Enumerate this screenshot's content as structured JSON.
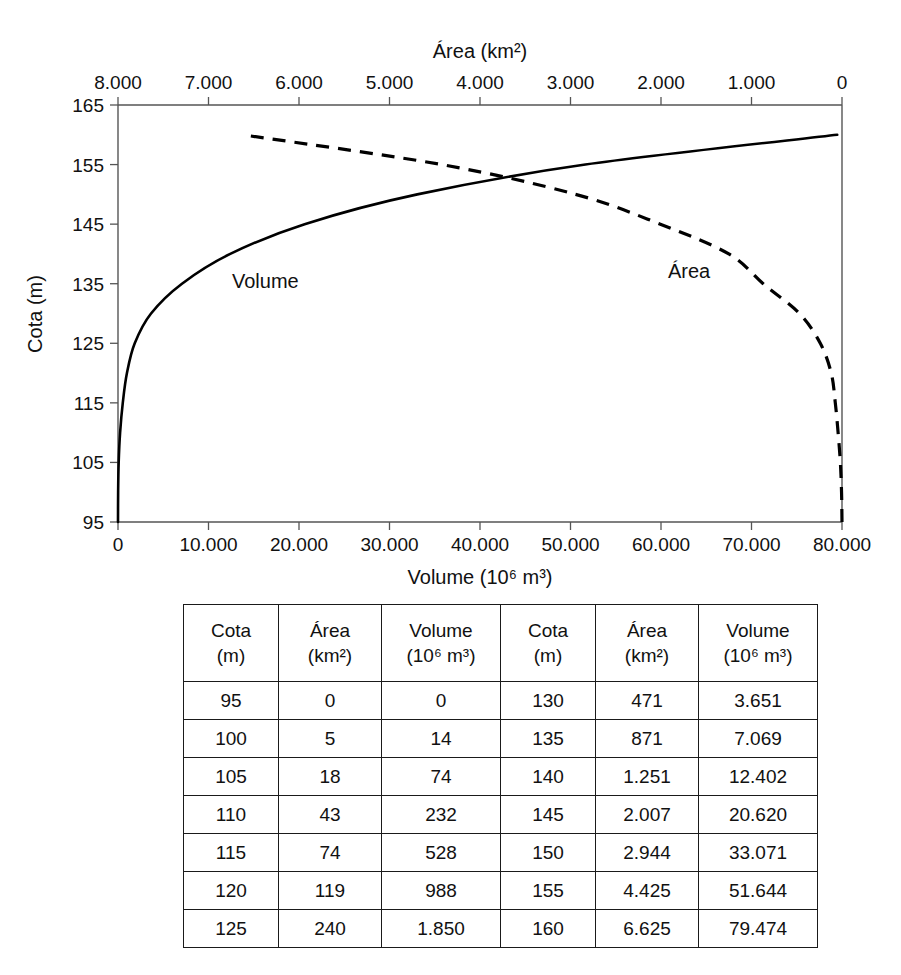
{
  "chart_data": {
    "type": "line",
    "title": "",
    "xlabel": "Volume (10⁶ m³)",
    "ylabel": "Cota (m)",
    "x2label": "Área (km²)",
    "grid": false,
    "legend_position": "inline",
    "ylim": [
      95,
      165
    ],
    "yticks": [
      95,
      105,
      115,
      125,
      135,
      145,
      155,
      165
    ],
    "ytick_labels": [
      "95",
      "105",
      "115",
      "125",
      "135",
      "145",
      "155",
      "165"
    ],
    "xlim": [
      0,
      80000
    ],
    "xticks": [
      0,
      10000,
      20000,
      30000,
      40000,
      50000,
      60000,
      70000,
      80000
    ],
    "xtick_labels": [
      "0",
      "10.000",
      "20.000",
      "30.000",
      "40.000",
      "50.000",
      "60.000",
      "70.000",
      "80.000"
    ],
    "x2lim": [
      8000,
      0
    ],
    "x2ticks": [
      8000,
      7000,
      6000,
      5000,
      4000,
      3000,
      2000,
      1000,
      0
    ],
    "x2tick_labels": [
      "8.000",
      "7.000",
      "6.000",
      "5.000",
      "4.000",
      "3.000",
      "2.000",
      "1.000",
      "0"
    ],
    "series": [
      {
        "name": "Volume",
        "style": "solid",
        "axis": "bottom",
        "label_text": "Volume",
        "x": [
          0,
          14,
          74,
          232,
          528,
          988,
          1850,
          3651,
          7069,
          12402,
          20620,
          33071,
          51644,
          79474
        ],
        "y": [
          95,
          100,
          105,
          110,
          115,
          120,
          125,
          130,
          135,
          140,
          145,
          150,
          155,
          160
        ]
      },
      {
        "name": "Área",
        "style": "dashed",
        "axis": "top",
        "label_text": "Área",
        "x": [
          0,
          5,
          18,
          43,
          74,
          119,
          240,
          471,
          871,
          1251,
          2007,
          2944,
          4425,
          6625
        ],
        "y": [
          95,
          100,
          105,
          110,
          115,
          120,
          125,
          130,
          135,
          140,
          145,
          150,
          155,
          160
        ]
      }
    ]
  },
  "tables": {
    "headers": [
      {
        "line1": "Cota",
        "line2": "(m)"
      },
      {
        "line1": "Área",
        "line2": "(km²)"
      },
      {
        "line1": "Volume",
        "line2": "(10⁶ m³)"
      }
    ],
    "left": {
      "rows": [
        [
          "95",
          "0",
          "0"
        ],
        [
          "100",
          "5",
          "14"
        ],
        [
          "105",
          "18",
          "74"
        ],
        [
          "110",
          "43",
          "232"
        ],
        [
          "115",
          "74",
          "528"
        ],
        [
          "120",
          "119",
          "988"
        ],
        [
          "125",
          "240",
          "1.850"
        ]
      ]
    },
    "right": {
      "rows": [
        [
          "130",
          "471",
          "3.651"
        ],
        [
          "135",
          "871",
          "7.069"
        ],
        [
          "140",
          "1.251",
          "12.402"
        ],
        [
          "145",
          "2.007",
          "20.620"
        ],
        [
          "150",
          "2.944",
          "33.071"
        ],
        [
          "155",
          "4.425",
          "51.644"
        ],
        [
          "160",
          "6.625",
          "79.474"
        ]
      ]
    }
  },
  "colors": {
    "ink": "#000000",
    "axis": "#555555",
    "background": "#ffffff"
  }
}
